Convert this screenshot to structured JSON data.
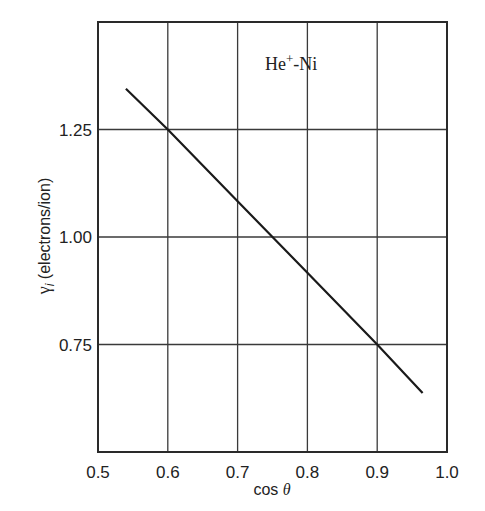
{
  "chart_data": {
    "type": "line",
    "title": "",
    "annotation": {
      "text": "He",
      "superscript": "+",
      "suffix": "-Ni",
      "full": "He+-Ni"
    },
    "xlabel": "cos θ",
    "xlabel_parts": {
      "prefix": "cos ",
      "symbol": "θ"
    },
    "ylabel": "γi (electrons/ion)",
    "ylabel_parts": {
      "symbol": "γ",
      "subscript": "i",
      "unit": " (electrons/ion)"
    },
    "xlim": [
      0.5,
      1.0
    ],
    "ylim": [
      0.5,
      1.5
    ],
    "xticks": [
      0.5,
      0.6,
      0.7,
      0.8,
      0.9,
      1.0
    ],
    "xtick_labels": [
      "0.5",
      "0.6",
      "0.7",
      "0.8",
      "0.9",
      "1.0"
    ],
    "yticks": [
      0.75,
      1.0,
      1.25
    ],
    "ytick_labels": [
      "0.75",
      "1.00",
      "1.25"
    ],
    "grid": true,
    "legend": null,
    "series": [
      {
        "name": "He+-Ni",
        "color": "#1a1a1a",
        "x": [
          0.54,
          0.6,
          0.7,
          0.75,
          0.8,
          0.9,
          0.965
        ],
        "y": [
          1.345,
          1.25,
          1.083,
          1.0,
          0.917,
          0.75,
          0.637
        ]
      }
    ]
  },
  "style": {
    "frame_color": "#2a2a2a",
    "grid_color": "#3a3a3a",
    "line_color": "#1a1a1a",
    "text_color": "#222222"
  }
}
